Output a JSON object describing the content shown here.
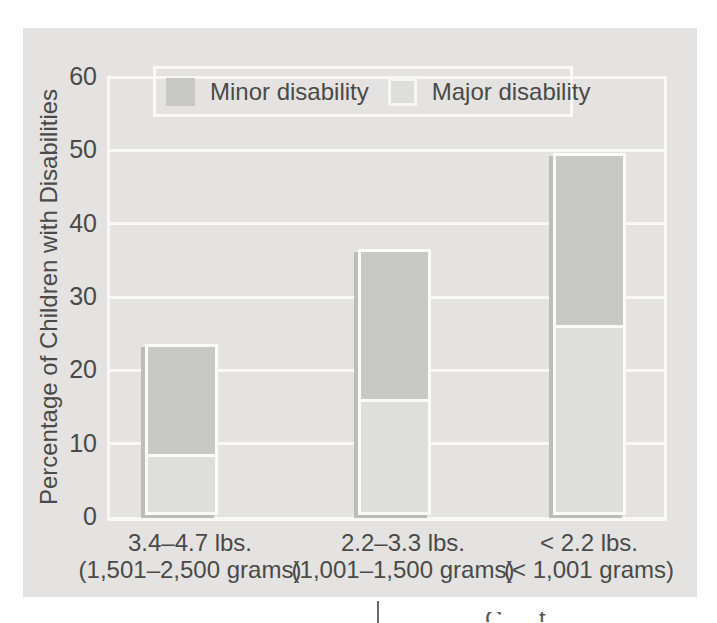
{
  "figure": {
    "legend": [
      {
        "label": "Minor disability",
        "color": "#c8c8c6",
        "bordered": false
      },
      {
        "label": "Major disability",
        "color": "#dededc",
        "bordered": true
      }
    ],
    "colors": {
      "panel_background": "#e4e3e1",
      "gridline": "#f8f8f6",
      "bar_border": "#fafaf8",
      "bar_shadow": "#bcbcba",
      "minor_disability": "#c8c8c6",
      "major_disability": "#dededc",
      "text": "#4a4a48"
    }
  },
  "chart_data": {
    "type": "bar",
    "stacked": true,
    "title": "",
    "xlabel": "",
    "ylabel": "Percentage of Children with Disabilities",
    "ylim": [
      0,
      60
    ],
    "yticks": [
      0,
      10,
      20,
      30,
      40,
      50,
      60
    ],
    "grid": true,
    "legend_position": "top",
    "categories": [
      {
        "line1": "3.4–4.7 lbs.",
        "line2": "(1,501–2,500 grams)"
      },
      {
        "line1": "2.2–3.3 lbs.",
        "line2": "(1,001–1,500 grams)"
      },
      {
        "line1": "< 2.2 lbs.",
        "line2": "(< 1,001 grams)"
      }
    ],
    "series": [
      {
        "name": "Major disability",
        "values": [
          7.5,
          15,
          25
        ],
        "color": "#dededc"
      },
      {
        "name": "Minor disability",
        "values": [
          15,
          20.5,
          23.5
        ],
        "color": "#c8c8c6"
      }
    ],
    "stack_totals": [
      22.5,
      35.5,
      48.5
    ]
  },
  "bottom_strip": {
    "partial_text": "C t I"
  }
}
